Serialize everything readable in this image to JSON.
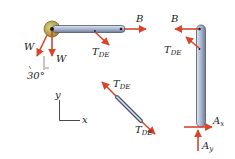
{
  "figure": {
    "labels": {
      "B_left_bar": "B",
      "TDE_left_bar_main": "T",
      "TDE_left_bar_sub": "DE",
      "W_slanted": "W",
      "W_vertical": "W",
      "angle": "30°",
      "axis_y": "y",
      "axis_x": "x",
      "TDE_member_top_main": "T",
      "TDE_member_top_sub": "DE",
      "TDE_member_bottom_main": "T",
      "TDE_member_bottom_sub": "DE",
      "B_right_bar": "B",
      "TDE_right_bar_main": "T",
      "TDE_right_bar_sub": "DE",
      "Ax_main": "A",
      "Ax_sub": "x",
      "Ay_main": "A",
      "Ay_sub": "y"
    },
    "colors": {
      "force_arrow": "#d9452b",
      "bar_fill": "#a9b6cf",
      "bar_stroke": "#4a5670",
      "pulley": "#b5a33f",
      "text": "#1a1a1a"
    }
  }
}
